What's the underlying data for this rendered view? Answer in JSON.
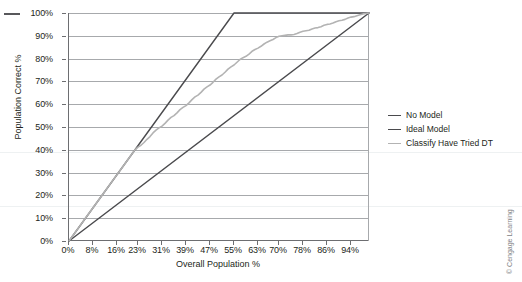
{
  "chart_data": {
    "type": "line",
    "title": "",
    "xlabel": "Overall Population %",
    "ylabel": "Population Correct %",
    "xlim": [
      0,
      100
    ],
    "ylim": [
      0,
      100
    ],
    "grid": "horizontal",
    "legend_position": "right",
    "x_tick_labels": [
      "0%",
      "8%",
      "16%",
      "23%",
      "31%",
      "39%",
      "47%",
      "55%",
      "63%",
      "70%",
      "78%",
      "86%",
      "94%"
    ],
    "x_tick_values": [
      0,
      8,
      16,
      23,
      31,
      39,
      47,
      55,
      63,
      70,
      78,
      86,
      94
    ],
    "y_tick_labels": [
      "0%",
      "10%",
      "20%",
      "30%",
      "40%",
      "50%",
      "60%",
      "70%",
      "80%",
      "90%",
      "100%"
    ],
    "y_tick_values": [
      0,
      10,
      20,
      30,
      40,
      50,
      60,
      70,
      80,
      90,
      100
    ],
    "series": [
      {
        "name": "No Model",
        "color": "#4a4a4d",
        "width": 1.4,
        "points": [
          [
            0,
            0
          ],
          [
            100,
            100
          ]
        ]
      },
      {
        "name": "Ideal Model",
        "color": "#4a4a4d",
        "width": 1.4,
        "points": [
          [
            0,
            0
          ],
          [
            55,
            100
          ],
          [
            100,
            100
          ]
        ]
      },
      {
        "name": "Classify Have Tried DT",
        "color": "#b3b3b3",
        "width": 1.6,
        "points": [
          [
            0,
            0
          ],
          [
            2,
            3.6
          ],
          [
            4,
            7.3
          ],
          [
            6,
            11.0
          ],
          [
            8,
            14.6
          ],
          [
            10,
            18.2
          ],
          [
            12,
            21.8
          ],
          [
            14,
            25.5
          ],
          [
            16,
            29.1
          ],
          [
            18,
            32.7
          ],
          [
            20,
            36.4
          ],
          [
            21,
            38.2
          ],
          [
            22,
            40.0
          ],
          [
            23,
            41.2
          ],
          [
            24,
            42.0
          ],
          [
            25,
            43.2
          ],
          [
            26,
            44.6
          ],
          [
            27,
            45.8
          ],
          [
            28,
            47.4
          ],
          [
            29,
            48.6
          ],
          [
            30,
            49.6
          ],
          [
            31,
            50.4
          ],
          [
            32,
            51.6
          ],
          [
            33,
            53.0
          ],
          [
            34,
            54.2
          ],
          [
            35,
            55.0
          ],
          [
            36,
            56.2
          ],
          [
            37,
            57.6
          ],
          [
            38,
            58.6
          ],
          [
            39,
            59.4
          ],
          [
            40,
            60.6
          ],
          [
            41,
            62.0
          ],
          [
            42,
            63.2
          ],
          [
            43,
            64.0
          ],
          [
            44,
            65.2
          ],
          [
            45,
            66.6
          ],
          [
            46,
            67.6
          ],
          [
            47,
            68.4
          ],
          [
            48,
            69.6
          ],
          [
            49,
            71.0
          ],
          [
            50,
            72.0
          ],
          [
            51,
            72.8
          ],
          [
            52,
            74.0
          ],
          [
            53,
            75.4
          ],
          [
            54,
            76.4
          ],
          [
            55,
            77.2
          ],
          [
            56,
            78.4
          ],
          [
            57,
            79.6
          ],
          [
            58,
            80.4
          ],
          [
            59,
            81.0
          ],
          [
            60,
            82.0
          ],
          [
            61,
            83.2
          ],
          [
            62,
            84.0
          ],
          [
            63,
            84.6
          ],
          [
            64,
            85.4
          ],
          [
            65,
            86.4
          ],
          [
            66,
            87.2
          ],
          [
            67,
            87.8
          ],
          [
            68,
            88.4
          ],
          [
            69,
            89.2
          ],
          [
            70,
            89.8
          ],
          [
            71,
            90.0
          ],
          [
            72,
            90.2
          ],
          [
            73,
            90.4
          ],
          [
            74,
            90.4
          ],
          [
            75,
            90.6
          ],
          [
            76,
            91.0
          ],
          [
            77,
            91.6
          ],
          [
            78,
            92.0
          ],
          [
            79,
            92.2
          ],
          [
            80,
            92.4
          ],
          [
            81,
            93.0
          ],
          [
            82,
            93.4
          ],
          [
            83,
            93.6
          ],
          [
            84,
            94.0
          ],
          [
            85,
            94.6
          ],
          [
            86,
            95.0
          ],
          [
            87,
            95.2
          ],
          [
            88,
            95.6
          ],
          [
            89,
            96.2
          ],
          [
            90,
            96.6
          ],
          [
            91,
            96.8
          ],
          [
            92,
            97.2
          ],
          [
            93,
            97.8
          ],
          [
            94,
            98.2
          ],
          [
            95,
            98.4
          ],
          [
            96,
            98.8
          ],
          [
            97,
            99.2
          ],
          [
            98,
            99.6
          ],
          [
            99,
            99.8
          ],
          [
            100,
            100
          ]
        ]
      }
    ]
  },
  "legend": {
    "items": [
      {
        "label": "No Model",
        "color": "#4a4a4d"
      },
      {
        "label": "Ideal Model",
        "color": "#4a4a4d"
      },
      {
        "label": "Classify Have Tried DT",
        "color": "#b3b3b3"
      }
    ]
  },
  "credit": {
    "text": "© Cengage Learning"
  },
  "colors": {
    "axis": "#6d6e71",
    "gridline": "#a7a9ac",
    "text": "#231f20",
    "dark_series": "#4a4a4d",
    "light_series": "#b3b3b3",
    "credit_text": "#808285",
    "background": "#ffffff"
  }
}
